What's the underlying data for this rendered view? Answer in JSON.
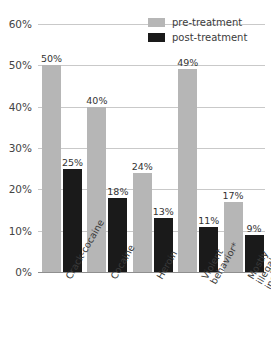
{
  "chart_data": {
    "type": "bar",
    "title": "",
    "xlabel": "",
    "ylabel": "",
    "ylim": [
      0,
      60
    ],
    "grid": true,
    "legend_position": "top-right",
    "categories": [
      "Crack-cocaine",
      "Cocaine",
      "Heroin",
      "Violent\nbehavior*",
      "Mostly illegal\nincome**"
    ],
    "series": [
      {
        "name": "pre-treatment",
        "color": "#b6b6b6",
        "values": [
          50,
          40,
          24,
          49,
          17
        ],
        "labels": [
          "50%",
          "40%",
          "24%",
          "49%",
          "17%"
        ]
      },
      {
        "name": "post-treatment",
        "color": "#1a1a1a",
        "values": [
          25,
          18,
          13,
          11,
          9
        ],
        "labels": [
          "25%",
          "18%",
          "13%",
          "11%",
          "9%"
        ]
      }
    ],
    "yticks": [
      0,
      10,
      20,
      30,
      40,
      50,
      60
    ],
    "ytick_labels": [
      "0%",
      "10%",
      "20%",
      "30%",
      "40%",
      "50%",
      "60%"
    ]
  },
  "legend": {
    "items": [
      {
        "label": "pre-treatment"
      },
      {
        "label": "post-treatment"
      }
    ]
  }
}
